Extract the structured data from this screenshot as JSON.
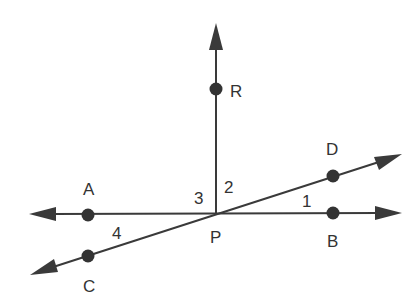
{
  "figure": {
    "points": {
      "P": "P",
      "R": "R",
      "A": "A",
      "B": "B",
      "C": "C",
      "D": "D"
    },
    "angles": {
      "a1": "1",
      "a2": "2",
      "a3": "3",
      "a4": "4"
    },
    "lines": [
      {
        "name": "ray PR",
        "through": [
          "P",
          "R"
        ],
        "arrows": "one end (up)"
      },
      {
        "name": "line AB",
        "through": [
          "A",
          "P",
          "B"
        ],
        "arrows": "both ends"
      },
      {
        "name": "line CD",
        "through": [
          "C",
          "P",
          "D"
        ],
        "arrows": "both ends"
      }
    ],
    "colors": {
      "ink": "#333333",
      "background": "#ffffff"
    }
  }
}
